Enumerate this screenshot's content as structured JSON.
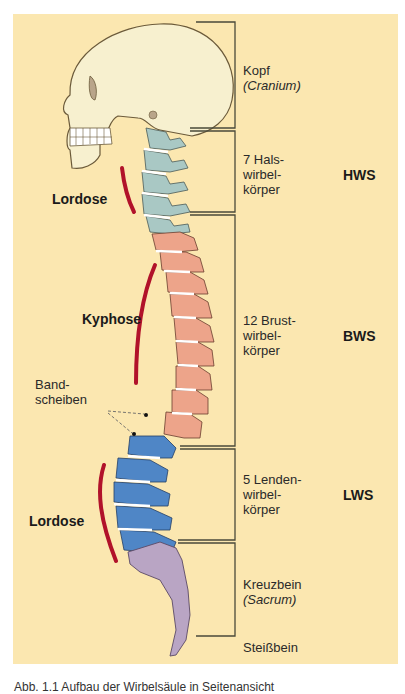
{
  "figure": {
    "background_color": "#fbe7b0",
    "colors": {
      "skull": "#f7f0cf",
      "cervical": "#a9c8c4",
      "thoracic": "#eda48a",
      "lumbar": "#4f86c6",
      "sacrum": "#b9a5c4",
      "curve": "#b1122a",
      "disc": "#ffffff",
      "bracket": "#4a4a3a"
    }
  },
  "regions": [
    {
      "label_line1": "Kopf",
      "label_line2": "(Cranium)",
      "label_line3": "",
      "abbr": ""
    },
    {
      "label_line1": "7 Hals-",
      "label_line2": "wirbel-",
      "label_line3": "körper",
      "abbr": "HWS"
    },
    {
      "label_line1": "12 Brust-",
      "label_line2": "wirbel-",
      "label_line3": "körper",
      "abbr": "BWS"
    },
    {
      "label_line1": "5 Lenden-",
      "label_line2": "wirbel-",
      "label_line3": "körper",
      "abbr": "LWS"
    },
    {
      "label_line1": "Kreuzbein",
      "label_line2": "(Sacrum)",
      "label_line3": "",
      "abbr": ""
    },
    {
      "label_line1": "Steißbein",
      "label_line2": "",
      "label_line3": "",
      "abbr": ""
    }
  ],
  "curvatures": [
    {
      "label": "Lordose"
    },
    {
      "label": "Kyphose"
    },
    {
      "label": "Lordose"
    }
  ],
  "annotation": {
    "line1": "Band-",
    "line2": "scheiben"
  },
  "caption": "Abb. 1.1 Aufbau der Wirbelsäule in Seitenansicht"
}
